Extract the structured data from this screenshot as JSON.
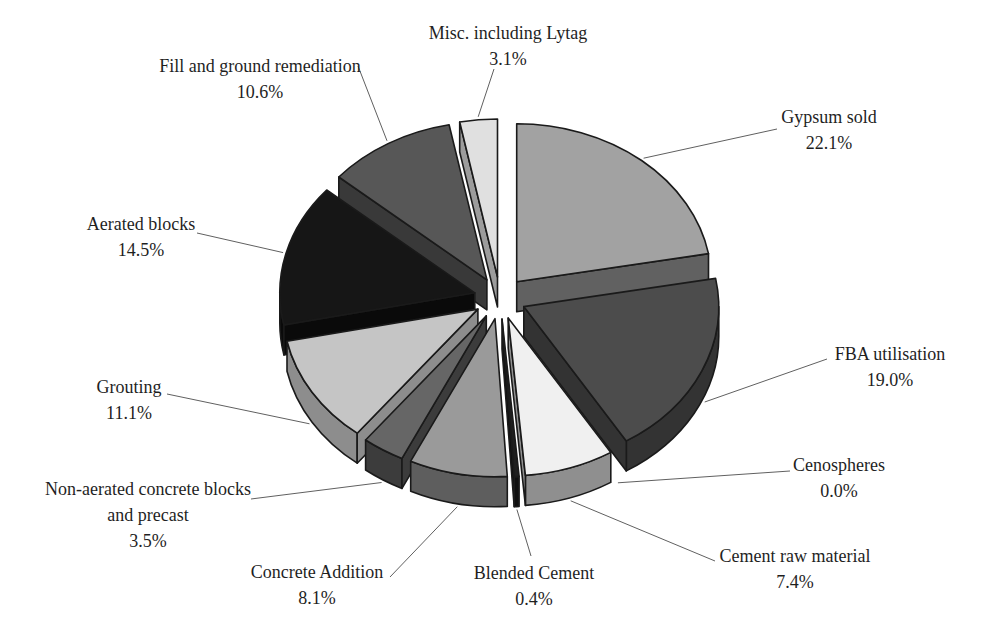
{
  "page": {
    "background": "#ffffff"
  },
  "chart_data": {
    "type": "pie",
    "style": "3d-exploded-grayscale",
    "unit": "percent",
    "direction": "clockwise",
    "start_angle": "12-oclock",
    "geometry": {
      "cx": 500,
      "cy": 298,
      "rx": 195,
      "ry": 158,
      "depth": 30,
      "explode": 26
    },
    "colors": {
      "outline": "#1a1a1a",
      "leader_line": "#606060",
      "text": "#1f1f1f",
      "background": "#ffffff"
    },
    "slices": [
      {
        "label": "Gypsum sold",
        "value": 22.1,
        "pct_text": "22.1%",
        "lines": [
          "Gypsum sold"
        ],
        "top_color": "#a2a2a2",
        "side_color": "#616161",
        "label_x": 829,
        "label_y": 104,
        "leader_from": [
          777,
          129
        ]
      },
      {
        "label": "FBA utilisation",
        "value": 19.0,
        "pct_text": "19.0%",
        "lines": [
          "FBA utilisation"
        ],
        "top_color": "#4c4c4c",
        "side_color": "#333333",
        "label_x": 890,
        "label_y": 341,
        "leader_from": [
          827,
          359
        ]
      },
      {
        "label": "Cenospheres",
        "value": 0.0,
        "pct_text": "0.0%",
        "lines": [
          "Cenospheres"
        ],
        "top_color": "#bbbbbb",
        "side_color": "#888888",
        "label_x": 839,
        "label_y": 452,
        "leader_from": [
          790,
          471
        ]
      },
      {
        "label": "Cement raw material",
        "value": 7.4,
        "pct_text": "7.4%",
        "lines": [
          "Cement raw material"
        ],
        "top_color": "#f0f0f0",
        "side_color": "#8f8f8f",
        "label_x": 795,
        "label_y": 543,
        "leader_from": [
          715,
          561
        ]
      },
      {
        "label": "Blended Cement",
        "value": 0.4,
        "pct_text": "0.4%",
        "lines": [
          "Blended Cement"
        ],
        "top_color": "#1f1f1f",
        "side_color": "#0f0f0f",
        "label_x": 534,
        "label_y": 560,
        "leader_from": [
          531,
          556
        ]
      },
      {
        "label": "Concrete Addition",
        "value": 8.1,
        "pct_text": "8.1%",
        "lines": [
          "Concrete Addition"
        ],
        "top_color": "#9a9a9a",
        "side_color": "#5e5e5e",
        "label_x": 317,
        "label_y": 559,
        "leader_from": [
          390,
          577
        ]
      },
      {
        "label": "Non-aerated concrete blocks and precast",
        "value": 3.5,
        "pct_text": "3.5%",
        "lines": [
          "Non-aerated concrete blocks",
          "and precast"
        ],
        "top_color": "#666666",
        "side_color": "#3c3c3c",
        "label_x": 148,
        "label_y": 476,
        "leader_from": [
          251,
          499
        ]
      },
      {
        "label": "Grouting",
        "value": 11.1,
        "pct_text": "11.1%",
        "lines": [
          "Grouting"
        ],
        "top_color": "#c5c5c5",
        "side_color": "#8d8d8d",
        "label_x": 129,
        "label_y": 374,
        "leader_from": [
          167,
          394
        ]
      },
      {
        "label": "Aerated blocks",
        "value": 14.5,
        "pct_text": "14.5%",
        "lines": [
          "Aerated blocks"
        ],
        "top_color": "#161616",
        "side_color": "#0a0a0a",
        "label_x": 141,
        "label_y": 211,
        "leader_from": [
          197,
          233
        ]
      },
      {
        "label": "Fill and ground remediation",
        "value": 10.6,
        "pct_text": "10.6%",
        "lines": [
          "Fill and ground remediation"
        ],
        "top_color": "#575757",
        "side_color": "#393939",
        "label_x": 260,
        "label_y": 53,
        "leader_from": [
          358,
          66
        ]
      },
      {
        "label": "Misc. including Lytag",
        "value": 3.1,
        "pct_text": "3.1%",
        "lines": [
          "Misc. including Lytag"
        ],
        "top_color": "#e0e0e0",
        "side_color": "#9c9c9c",
        "label_x": 508,
        "label_y": 20,
        "leader_from": [
          494,
          69
        ]
      }
    ]
  }
}
